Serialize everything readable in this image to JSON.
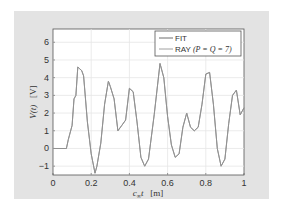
{
  "chart_data": {
    "type": "line",
    "title": "",
    "xlabel": "c∞t   [m]",
    "ylabel": "V(t)   [V]",
    "xlim": [
      0,
      1
    ],
    "ylim": [
      -1.5,
      6.75
    ],
    "xticks": [
      "0",
      "0.2",
      "0.4",
      "0.6",
      "0.8",
      "1"
    ],
    "yticks": [
      "-1",
      "0",
      "1",
      "2",
      "3",
      "4",
      "5",
      "6"
    ],
    "grid": true,
    "legend": {
      "position": "upper right",
      "entries": [
        "FIT",
        "RAY (P = Q = 7)"
      ]
    },
    "series": [
      {
        "name": "FIT",
        "x": [
          0.0,
          0.07,
          0.08,
          0.1,
          0.11,
          0.12,
          0.13,
          0.14,
          0.15,
          0.16,
          0.18,
          0.2,
          0.22,
          0.23,
          0.25,
          0.27,
          0.29,
          0.3,
          0.32,
          0.34,
          0.36,
          0.38,
          0.4,
          0.42,
          0.44,
          0.46,
          0.48,
          0.5,
          0.53,
          0.56,
          0.58,
          0.6,
          0.62,
          0.64,
          0.66,
          0.68,
          0.7,
          0.72,
          0.74,
          0.76,
          0.78,
          0.8,
          0.82,
          0.84,
          0.86,
          0.88,
          0.9,
          0.92,
          0.94,
          0.96,
          0.98,
          1.0
        ],
        "y": [
          0.0,
          0.0,
          0.5,
          1.3,
          2.8,
          3.0,
          4.6,
          4.5,
          4.4,
          4.1,
          1.5,
          -0.3,
          -1.4,
          -1.0,
          0.3,
          2.5,
          3.8,
          3.5,
          2.8,
          1.0,
          1.3,
          1.6,
          3.4,
          3.2,
          1.5,
          -0.5,
          -1.0,
          -0.6,
          1.9,
          4.8,
          4.0,
          1.8,
          0.2,
          -0.5,
          -0.3,
          1.2,
          2.0,
          1.2,
          1.0,
          1.2,
          2.5,
          4.2,
          4.3,
          2.5,
          0.0,
          -1.0,
          -0.6,
          1.4,
          3.0,
          3.3,
          1.9,
          2.3
        ]
      },
      {
        "name": "RAY (P = Q = 7)",
        "x": [
          0.0,
          0.07,
          0.08,
          0.1,
          0.11,
          0.12,
          0.13,
          0.14,
          0.15,
          0.16,
          0.18,
          0.2,
          0.22,
          0.23,
          0.25,
          0.27,
          0.29,
          0.3,
          0.32,
          0.34,
          0.36,
          0.38,
          0.4,
          0.42,
          0.44,
          0.46,
          0.48,
          0.5,
          0.53,
          0.56,
          0.58,
          0.6,
          0.62,
          0.64,
          0.66,
          0.68,
          0.7,
          0.72,
          0.74,
          0.76,
          0.78,
          0.8,
          0.82,
          0.84,
          0.86,
          0.88,
          0.9,
          0.92,
          0.94,
          0.96,
          0.98,
          1.0
        ],
        "y": [
          0.0,
          0.0,
          0.5,
          1.3,
          2.8,
          3.0,
          4.6,
          4.5,
          4.4,
          4.1,
          1.5,
          -0.3,
          -1.4,
          -1.0,
          0.3,
          2.5,
          3.8,
          3.5,
          2.8,
          1.0,
          1.3,
          1.6,
          3.4,
          3.2,
          1.5,
          -0.5,
          -1.0,
          -0.6,
          1.9,
          4.8,
          4.0,
          1.8,
          0.2,
          -0.5,
          -0.3,
          1.2,
          2.0,
          1.2,
          1.0,
          1.2,
          2.5,
          4.2,
          4.3,
          2.5,
          0.0,
          -1.0,
          -0.6,
          1.4,
          3.0,
          3.3,
          1.9,
          2.3
        ]
      }
    ]
  },
  "colors": {
    "panel_bg": "#e3e3e3",
    "plot_bg": "#ffffff",
    "grid": "#e6e6e6",
    "fit_line": "#6e6e6e",
    "ray_line": "#a0a0a0",
    "text": "#333333"
  }
}
